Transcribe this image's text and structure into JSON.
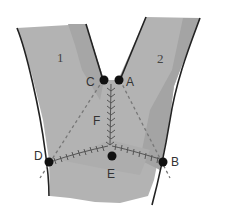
{
  "diagram": {
    "type": "y-shaped-flap-incision",
    "regions": [
      {
        "id": "region-1",
        "label": "1"
      },
      {
        "id": "region-2",
        "label": "2"
      }
    ],
    "points": [
      {
        "id": "A",
        "label": "A"
      },
      {
        "id": "B",
        "label": "B"
      },
      {
        "id": "C",
        "label": "C"
      },
      {
        "id": "D",
        "label": "D"
      },
      {
        "id": "E",
        "label": "E"
      },
      {
        "id": "F",
        "label": "F"
      }
    ],
    "colors": {
      "fill_light": "#b5b5b5",
      "fill_dark": "#a4a4a4",
      "outline": "#222222",
      "suture": "#555555",
      "dashed": "#777777",
      "point": "#111111"
    }
  }
}
